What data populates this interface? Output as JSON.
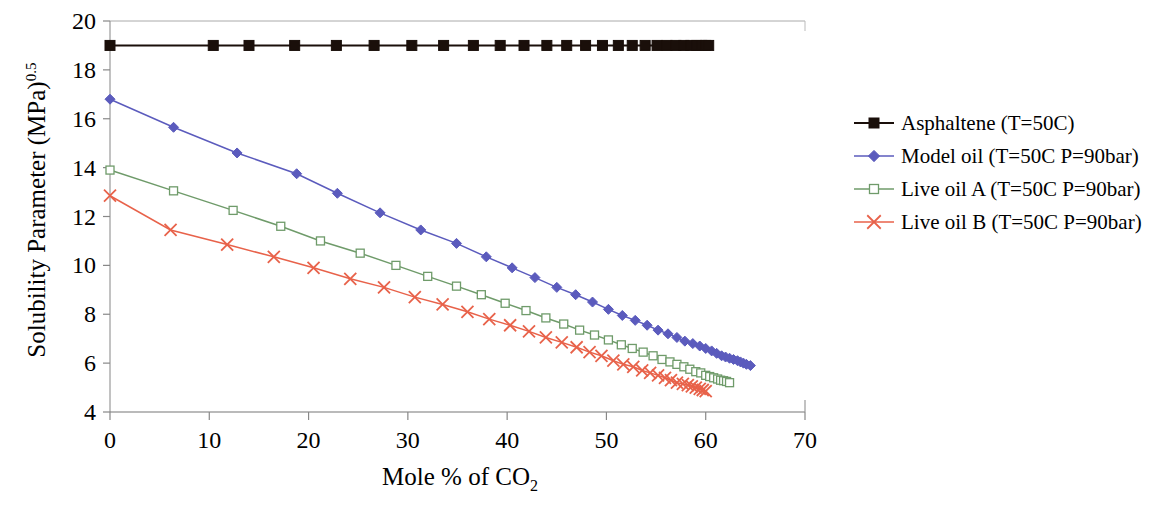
{
  "chart_data": {
    "type": "line",
    "title": "",
    "xlabel": "Mole % of CO2",
    "xlabel_main": "Mole % of CO",
    "xlabel_sub": "2",
    "ylabel": "Solubility Parameter (MPa)0.5",
    "ylabel_main": "Solubility Parameter (MPa)",
    "ylabel_sup": "0.5",
    "xlim": [
      0,
      70
    ],
    "ylim": [
      4,
      20
    ],
    "xticks": [
      0,
      10,
      20,
      30,
      40,
      50,
      60,
      70
    ],
    "yticks": [
      4,
      6,
      8,
      10,
      12,
      14,
      16,
      18,
      20
    ],
    "grid": false,
    "legend_position": "right",
    "series": [
      {
        "name": "Asphaltene (T=50C)",
        "color": "#1a0f0a",
        "marker": "filled-square",
        "x": [
          0,
          10.4,
          14.0,
          18.6,
          22.8,
          26.6,
          30.4,
          33.6,
          36.6,
          39.3,
          41.7,
          44.0,
          46.0,
          47.9,
          49.6,
          51.2,
          52.6,
          53.9,
          55.1,
          56.1,
          57.0,
          57.8,
          58.5,
          59.1,
          59.6,
          60.0,
          60.3
        ],
        "y": [
          19.0,
          19.0,
          19.0,
          19.0,
          19.0,
          19.0,
          19.0,
          19.0,
          19.0,
          19.0,
          19.0,
          19.0,
          19.0,
          19.0,
          19.0,
          19.0,
          19.0,
          19.0,
          19.0,
          19.0,
          19.0,
          19.0,
          19.0,
          19.0,
          19.0,
          19.0,
          19.0
        ]
      },
      {
        "name": "Model oil (T=50C P=90bar)",
        "color": "#5b5bbd",
        "marker": "filled-diamond",
        "x": [
          0,
          6.4,
          12.8,
          18.8,
          22.9,
          27.2,
          31.3,
          34.9,
          37.9,
          40.5,
          42.8,
          45.0,
          46.9,
          48.6,
          50.2,
          51.6,
          52.9,
          54.1,
          55.2,
          56.2,
          57.1,
          57.9,
          58.7,
          59.4,
          60.0,
          60.6,
          61.1,
          61.6,
          62.0,
          62.4,
          62.8,
          63.2,
          63.5,
          63.8,
          64.1,
          64.5
        ],
        "y": [
          16.8,
          15.65,
          14.6,
          13.75,
          12.95,
          12.15,
          11.45,
          10.9,
          10.35,
          9.9,
          9.5,
          9.1,
          8.8,
          8.5,
          8.2,
          7.95,
          7.75,
          7.55,
          7.35,
          7.2,
          7.05,
          6.9,
          6.8,
          6.7,
          6.6,
          6.5,
          6.4,
          6.3,
          6.25,
          6.2,
          6.15,
          6.1,
          6.05,
          6.0,
          5.95,
          5.9
        ]
      },
      {
        "name": "Live oil A (T=50C P=90bar)",
        "color": "#6f9b6a",
        "marker": "open-square",
        "x": [
          0,
          6.4,
          12.4,
          17.2,
          21.2,
          25.2,
          28.8,
          32.0,
          34.9,
          37.4,
          39.8,
          41.9,
          43.9,
          45.7,
          47.3,
          48.8,
          50.2,
          51.5,
          52.6,
          53.7,
          54.7,
          55.6,
          56.4,
          57.1,
          57.8,
          58.4,
          59.0,
          59.5,
          60.0,
          60.4,
          60.8,
          61.2,
          61.5,
          61.8,
          62.1,
          62.4
        ],
        "y": [
          13.9,
          13.05,
          12.25,
          11.6,
          11.0,
          10.5,
          10.0,
          9.55,
          9.15,
          8.8,
          8.45,
          8.15,
          7.85,
          7.6,
          7.35,
          7.15,
          6.95,
          6.75,
          6.6,
          6.45,
          6.3,
          6.15,
          6.05,
          5.95,
          5.85,
          5.75,
          5.65,
          5.6,
          5.5,
          5.45,
          5.4,
          5.35,
          5.3,
          5.28,
          5.25,
          5.2
        ]
      },
      {
        "name": "Live oil B (T=50C P=90bar)",
        "color": "#e8624a",
        "marker": "cross-x",
        "x": [
          0,
          6.1,
          11.8,
          16.5,
          20.5,
          24.2,
          27.6,
          30.7,
          33.5,
          36.0,
          38.2,
          40.3,
          42.2,
          43.9,
          45.5,
          47.0,
          48.3,
          49.5,
          50.7,
          51.7,
          52.7,
          53.6,
          54.4,
          55.2,
          55.9,
          56.5,
          57.1,
          57.7,
          58.2,
          58.6,
          59.0,
          59.4,
          59.7,
          60.0
        ],
        "y": [
          12.85,
          11.45,
          10.85,
          10.35,
          9.9,
          9.45,
          9.1,
          8.7,
          8.4,
          8.1,
          7.8,
          7.55,
          7.3,
          7.05,
          6.85,
          6.65,
          6.45,
          6.3,
          6.1,
          5.95,
          5.85,
          5.7,
          5.6,
          5.5,
          5.4,
          5.3,
          5.2,
          5.15,
          5.1,
          5.05,
          5.0,
          4.95,
          4.9,
          4.85
        ]
      }
    ]
  },
  "legend": {
    "items": [
      {
        "label": "Asphaltene (T=50C)"
      },
      {
        "label": "Model oil (T=50C  P=90bar)"
      },
      {
        "label": "Live oil A (T=50C  P=90bar)"
      },
      {
        "label": "Live oil B (T=50C  P=90bar)"
      }
    ]
  }
}
